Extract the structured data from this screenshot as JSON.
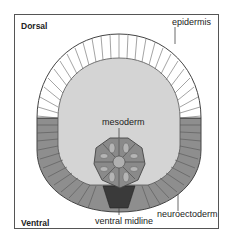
{
  "figure": {
    "orientation": {
      "top": "Dorsal",
      "bottom": "Ventral"
    },
    "labels": {
      "epidermis": "epidermis",
      "mesoderm": "mesoderm",
      "neuroectoderm": "neuroectoderm",
      "ventral_midline": "ventral midline"
    },
    "colors": {
      "epidermis_fill": "#ffffff",
      "neuroectoderm_fill": "#8e8e8e",
      "cavity_fill": "#d4d4d4",
      "mesoderm_fill": "#8a8a8a",
      "midline_fill": "#3a3a3a",
      "outline": "#444444"
    }
  }
}
